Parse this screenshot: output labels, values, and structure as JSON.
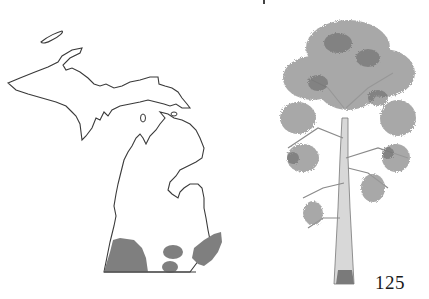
{
  "page": {
    "number": "125",
    "type": "field-guide-species-page"
  },
  "map": {
    "region": "Michigan",
    "outline_color": "#3a3a3a",
    "range_color": "#7f7f7f",
    "range_areas": [
      "southwest Lower Peninsula",
      "south-central (two small patches)",
      "southeast Lower Peninsula"
    ]
  },
  "illustration": {
    "subject": "tree",
    "style": "pencil sketch"
  }
}
